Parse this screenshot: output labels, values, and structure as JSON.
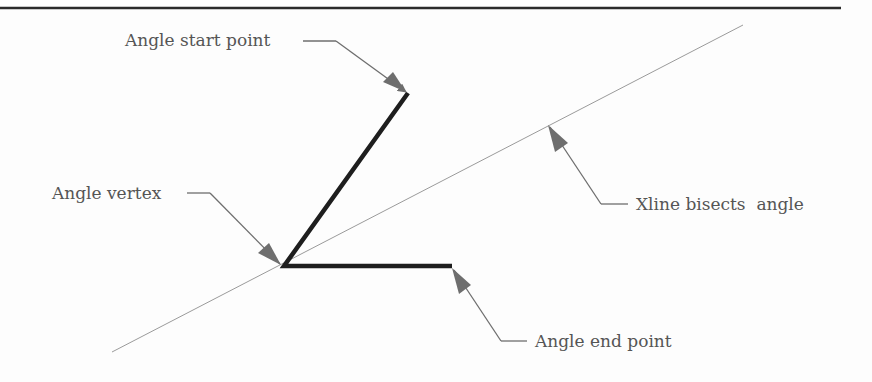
{
  "diagram": {
    "type": "xline-bisect-illustration",
    "colors": {
      "background": "#fdfdfd",
      "angle_lines": "#1e1e1e",
      "xline": "#9a9a9a",
      "leaders": "#6e6e6e",
      "top_rule": "#2a2a2a",
      "text": "#555555"
    },
    "labels": {
      "start_point": "Angle start point",
      "vertex": "Angle vertex",
      "xline": "Xline bisects  angle",
      "end_point": "Angle end point"
    },
    "geometry": {
      "vertex": [
        284,
        266
      ],
      "start_point": [
        408,
        93
      ],
      "end_point": [
        452,
        266
      ],
      "xline_from": [
        112,
        352
      ],
      "xline_to": [
        743,
        25
      ]
    }
  }
}
